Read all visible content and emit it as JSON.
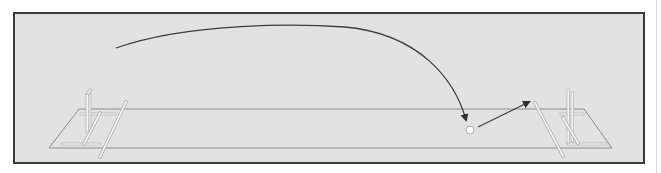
{
  "diagram": {
    "colors": {
      "background": "#e2e2e2",
      "frame_border": "#3a3a3a",
      "pitch_outline": "#8a8a8a",
      "trajectory": "#3c3c3c",
      "ball": "#ffffff",
      "stumps": "#f4f4f4"
    },
    "elements": {
      "trajectory": {
        "start": [
          116,
          48
        ],
        "peak": [
          330,
          26
        ],
        "end": [
          466,
          122
        ]
      },
      "ball": {
        "center": [
          470,
          130
        ],
        "radius": 4
      },
      "bounce_arrow": {
        "start": [
          478,
          127
        ],
        "end": [
          531,
          101
        ]
      },
      "left_wicket": {
        "x": 88
      },
      "right_wicket": {
        "x": 568
      }
    }
  }
}
